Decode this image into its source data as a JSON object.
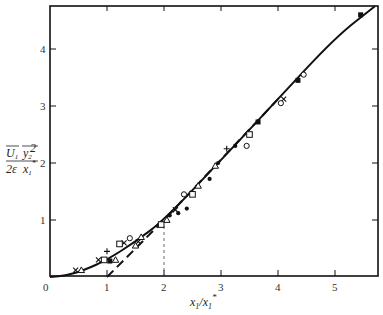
{
  "chart_data": {
    "type": "scatter",
    "title": "",
    "xlabel": "x1/x1*",
    "ylabel": "U1 y2^2 / (2ε x1*)",
    "xlim": [
      0,
      5.7
    ],
    "ylim": [
      0,
      4.75
    ],
    "grid": false,
    "legend": null,
    "x_ticks": [
      0,
      1,
      2,
      3,
      4,
      5
    ],
    "x_tick_labels": [
      "0",
      "1",
      "2",
      "3",
      "4",
      "5"
    ],
    "y_ticks": [
      1,
      2,
      3,
      4
    ],
    "y_tick_labels": [
      "1",
      "2",
      "3",
      "4"
    ],
    "series": [
      {
        "name": "cross",
        "marker": "x",
        "points": [
          [
            0.45,
            0.12
          ],
          [
            0.85,
            0.3
          ],
          [
            1.3,
            0.6
          ],
          [
            1.55,
            0.62
          ],
          [
            2.2,
            1.18
          ],
          [
            4.1,
            3.12
          ]
        ]
      },
      {
        "name": "open-triangle",
        "marker": "triangle-open",
        "points": [
          [
            0.55,
            0.12
          ],
          [
            1.15,
            0.3
          ],
          [
            1.5,
            0.55
          ],
          [
            1.6,
            0.7
          ],
          [
            2.05,
            1.0
          ],
          [
            2.6,
            1.6
          ],
          [
            2.9,
            1.95
          ]
        ]
      },
      {
        "name": "open-square",
        "marker": "square-open",
        "points": [
          [
            0.95,
            0.3
          ],
          [
            1.22,
            0.58
          ],
          [
            1.95,
            0.92
          ],
          [
            2.5,
            1.45
          ],
          [
            3.5,
            2.5
          ]
        ]
      },
      {
        "name": "filled-square",
        "marker": "square-filled",
        "points": [
          [
            1.05,
            0.28
          ],
          [
            3.65,
            2.72
          ],
          [
            4.35,
            3.45
          ],
          [
            5.45,
            4.6
          ]
        ]
      },
      {
        "name": "plus",
        "marker": "plus",
        "points": [
          [
            1.0,
            0.45
          ],
          [
            3.1,
            2.25
          ]
        ]
      },
      {
        "name": "open-circle",
        "marker": "circle-open",
        "points": [
          [
            1.4,
            0.68
          ],
          [
            2.35,
            1.45
          ],
          [
            3.45,
            2.3
          ],
          [
            4.05,
            3.05
          ],
          [
            4.45,
            3.55
          ]
        ]
      },
      {
        "name": "filled-circle",
        "marker": "circle-filled",
        "points": [
          [
            2.1,
            1.08
          ],
          [
            2.25,
            1.12
          ],
          [
            2.4,
            1.2
          ],
          [
            2.8,
            1.72
          ],
          [
            2.95,
            2.0
          ],
          [
            3.25,
            2.3
          ]
        ]
      }
    ],
    "curves": [
      {
        "name": "theory-solid",
        "style": "solid",
        "points": [
          [
            0,
            0
          ],
          [
            0.3,
            0.03
          ],
          [
            0.6,
            0.12
          ],
          [
            1.0,
            0.3
          ],
          [
            1.5,
            0.62
          ],
          [
            2.0,
            1.0
          ],
          [
            3.0,
            2.05
          ],
          [
            4.0,
            3.12
          ],
          [
            5.0,
            4.2
          ],
          [
            5.7,
            4.75
          ]
        ]
      },
      {
        "name": "asymptote-dashed",
        "style": "dashed",
        "points": [
          [
            1.0,
            0
          ],
          [
            2.0,
            1.0
          ],
          [
            4.0,
            3.12
          ]
        ]
      },
      {
        "name": "reference-vertical",
        "style": "dashed-thin",
        "points": [
          [
            2.0,
            0
          ],
          [
            2.0,
            1.0
          ]
        ]
      }
    ]
  },
  "axes": {
    "x_label_main": "x",
    "x_label_sub1": "1",
    "x_label_slash": "/x",
    "x_label_sub2": "1",
    "x_label_sup": "*",
    "y_label_num_U": "U",
    "y_label_num_U_sub": "1",
    "y_label_num_y": "y",
    "y_label_num_y_sub": "2",
    "y_label_num_y_sup": "2",
    "y_label_den_left": "2ε",
    "y_label_den_x": "x",
    "y_label_den_x_sub": "1",
    "y_label_den_x_sup": "*"
  }
}
